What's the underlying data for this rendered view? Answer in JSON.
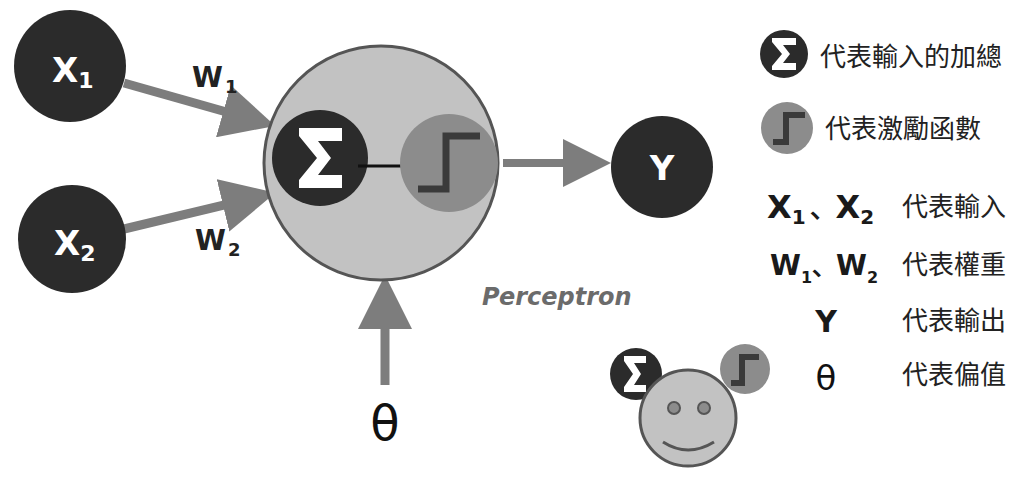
{
  "colors": {
    "dark_node": "#2b2b2b",
    "neuron_fill": "#c2c2c2",
    "neuron_stroke": "#555555",
    "activation_fill": "#8c8c8c",
    "arrow": "#7d7d7d",
    "text": "#222222",
    "perceptron_text": "#6b6b6b"
  },
  "inputs": [
    {
      "name": "X",
      "sub": "1"
    },
    {
      "name": "X",
      "sub": "2"
    }
  ],
  "weights": [
    {
      "name": "W",
      "sub": "1"
    },
    {
      "name": "W",
      "sub": "2"
    }
  ],
  "output": {
    "name": "Y"
  },
  "bias": {
    "symbol": "θ"
  },
  "neuron": {
    "sum_symbol": "Σ",
    "activation_icon": "step-function-icon",
    "caption": "Perceptron"
  },
  "legend": [
    {
      "icon": "sigma-icon",
      "text": "代表輸入的加總"
    },
    {
      "icon": "step-function-icon",
      "text": "代表激勵函數"
    },
    {
      "symbol": "X₁ 、X₂",
      "sym_a": "X",
      "sub_a": "1",
      "sep": "、",
      "sym_b": "X",
      "sub_b": "2",
      "text": "代表輸入"
    },
    {
      "symbol": "W₁ 、W₂",
      "sym_a": "W",
      "sub_a": "1",
      "sep": "、",
      "sym_b": "W",
      "sub_b": "2",
      "text": "代表權重"
    },
    {
      "symbol": "Y",
      "text": "代表輸出"
    },
    {
      "symbol": "θ",
      "text": "代表偏值"
    }
  ],
  "mascot": {
    "icon": "smiley-face-icon"
  }
}
